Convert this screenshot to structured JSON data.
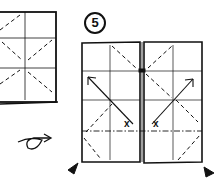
{
  "diagram": {
    "type": "origami-instructions",
    "step_number": "5",
    "symbols": {
      "valley_fold": "dashed line",
      "mountain_fold": "dash-dot line",
      "fold_direction": "arrow",
      "reference_point": "x",
      "turn_over": "looped arrow",
      "push_in": "black triangle"
    },
    "colors": {
      "ink": "#111111",
      "paper": "#ffffff"
    }
  }
}
